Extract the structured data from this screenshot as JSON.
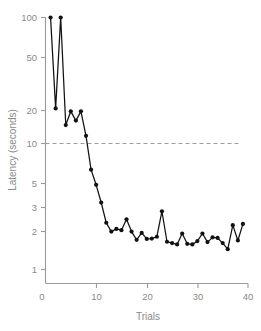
{
  "chart_data": {
    "type": "line",
    "title": "",
    "xlabel": "Trials",
    "ylabel": "Latency (seconds)",
    "yscale": "log",
    "xlim": [
      0,
      40
    ],
    "ylim": [
      1,
      100
    ],
    "grid": false,
    "legend": null,
    "x_ticks": [
      0,
      10,
      20,
      30,
      40
    ],
    "x_tick_labels": [
      "0",
      "10",
      "20",
      "30",
      "40"
    ],
    "y_ticks": [
      1,
      2,
      3,
      5,
      10,
      20,
      50,
      100
    ],
    "y_tick_labels": [
      "1",
      "2",
      "3",
      "5",
      "10",
      "20",
      "50",
      "100"
    ],
    "y_origin_label": "0",
    "marker": "filled-circle",
    "line_color": "#111111",
    "marker_color": "#111111",
    "axis_color": "#9a9a9a",
    "text_color": "#8a8a8a",
    "annotations": [
      {
        "kind": "horizontal-reference-line",
        "y": 10,
        "x_start": 0,
        "x_end": 38.5,
        "style": "dashed",
        "color": "#9e9e9e",
        "label": ""
      }
    ],
    "series": [
      {
        "name": "latency",
        "x": [
          1,
          2,
          3,
          4,
          5,
          6,
          7,
          8,
          9,
          10,
          11,
          12,
          13,
          14,
          15,
          16,
          17,
          18,
          19,
          20,
          21,
          22,
          23,
          24,
          25,
          26,
          27,
          28,
          29,
          30,
          31,
          32,
          33,
          34,
          35,
          36,
          37,
          38,
          39
        ],
        "values": [
          100,
          19,
          100,
          14,
          18,
          15.2,
          18,
          11.5,
          6.2,
          4.7,
          3.4,
          2.35,
          2.0,
          2.1,
          2.05,
          2.5,
          2.0,
          1.72,
          1.95,
          1.75,
          1.76,
          1.82,
          2.9,
          1.66,
          1.62,
          1.58,
          1.93,
          1.6,
          1.58,
          1.68,
          1.93,
          1.65,
          1.8,
          1.78,
          1.62,
          1.45,
          2.25,
          1.7,
          2.3
        ]
      }
    ]
  },
  "axes": {
    "y_title": "Latency (seconds)",
    "x_title": "Trials"
  }
}
